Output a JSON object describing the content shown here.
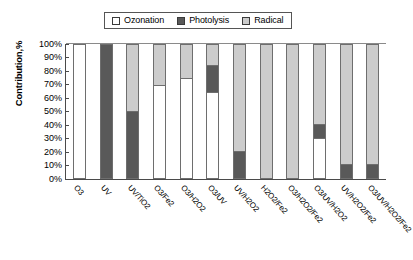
{
  "chart_data": {
    "type": "bar",
    "subtype": "stacked-bar-100-percent",
    "title": "",
    "xlabel": "",
    "ylabel": "Contribution,%",
    "ylim": [
      0,
      100
    ],
    "ytick_labels": [
      "100%",
      "90%",
      "80%",
      "70%",
      "60%",
      "50%",
      "40%",
      "30%",
      "20%",
      "10%",
      "0%"
    ],
    "ytick_values": [
      100,
      90,
      80,
      70,
      60,
      50,
      40,
      30,
      20,
      10,
      0
    ],
    "grid": false,
    "legend_position": "top-center",
    "categories": [
      "O3",
      "UV",
      "UV/TiO2",
      "O3/Fe2",
      "O3/H2O2",
      "O3/UV",
      "UV/H2O2",
      "H2O2/Fe2",
      "O3/H2O2/Fe2",
      "O3/UV/H2O2",
      "UV/H2O2/Fe2",
      "O3/UV/H2O2/Fe2"
    ],
    "series": [
      {
        "name": "Ozonation",
        "color": "#ffffff",
        "values": [
          100,
          0,
          0,
          70,
          75,
          65,
          0,
          0,
          0,
          30,
          0,
          0
        ]
      },
      {
        "name": "Photolysis",
        "color": "#595959",
        "values": [
          0,
          100,
          50,
          0,
          0,
          20,
          20,
          0,
          0,
          10,
          10,
          10
        ]
      },
      {
        "name": "Radical",
        "color": "#cccccc",
        "values": [
          0,
          0,
          50,
          30,
          25,
          15,
          80,
          100,
          100,
          60,
          90,
          90
        ]
      }
    ]
  },
  "legend": {
    "items": [
      {
        "label": "Ozonation",
        "swatch": "#ffffff"
      },
      {
        "label": "Photolysis",
        "swatch": "#595959"
      },
      {
        "label": "Radical",
        "swatch": "#cccccc"
      }
    ]
  }
}
